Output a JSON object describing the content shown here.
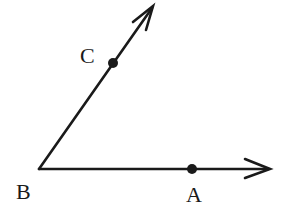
{
  "diagram": {
    "type": "angle",
    "colors": {
      "stroke": "#1a1a1a",
      "background": "#ffffff"
    },
    "vertex": {
      "label": "B",
      "x": 39,
      "y": 169
    },
    "rays": [
      {
        "name": "ray-BC",
        "from": "B",
        "through": "C",
        "tip": {
          "x": 153,
          "y": 6
        }
      },
      {
        "name": "ray-BA",
        "from": "B",
        "through": "A",
        "tip": {
          "x": 270,
          "y": 169
        }
      }
    ],
    "points": [
      {
        "label": "C",
        "x": 113,
        "y": 63
      },
      {
        "label": "A",
        "x": 192,
        "y": 169
      }
    ],
    "labels": {
      "B": "B",
      "C": "C",
      "A": "A"
    }
  }
}
